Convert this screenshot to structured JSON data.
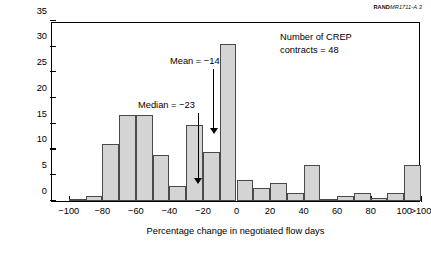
{
  "source_id": {
    "prefix": "RAND",
    "number": "MR1711-A.3"
  },
  "note": {
    "line1": "Number of CREP",
    "line2": "contracts = 48"
  },
  "annotations": [
    {
      "name": "mean-annotation",
      "label": "Mean = −14",
      "value": -14
    },
    {
      "name": "median-annotation",
      "label": "Median = −23",
      "value": -23
    }
  ],
  "chart_data": {
    "type": "bar",
    "title": "",
    "subtitle": "",
    "xlabel": "Percentage change in negotiated flow days",
    "ylabel": "Percentage of NIINs (n = 319)",
    "xlim": [
      -110,
      110
    ],
    "ylim": [
      0,
      35
    ],
    "yticks": [
      0,
      5,
      10,
      15,
      20,
      25,
      30,
      35
    ],
    "ytick_labels": [
      "0",
      "5",
      "10",
      "15",
      "20",
      "25",
      "30",
      "35"
    ],
    "xticks": [
      -100,
      -80,
      -60,
      -40,
      -20,
      0,
      20,
      40,
      60,
      80,
      100,
      110
    ],
    "xtick_labels": [
      "−100",
      "−80",
      "−60",
      "−40",
      "−20",
      "0",
      "20",
      "40",
      "60",
      "80",
      "100",
      ">100"
    ],
    "grid": false,
    "legend": null,
    "bin_width": 10,
    "categories": [
      "-100 to -90",
      "-90 to -80",
      "-80 to -70",
      "-70 to -60",
      "-60 to -50",
      "-50 to -40",
      "-40 to -30",
      "-30 to -20",
      "-20 to -10",
      "-10 to 0",
      "0 to 10",
      "10 to 20",
      "20 to 30",
      "30 to 40",
      "40 to 50",
      "50 to 60",
      "60 to 70",
      "70 to 80",
      "80 to 90",
      "90 to 100",
      ">100"
    ],
    "bin_starts": [
      -100,
      -90,
      -80,
      -70,
      -60,
      -50,
      -40,
      -30,
      -20,
      -10,
      0,
      10,
      20,
      30,
      40,
      50,
      60,
      70,
      80,
      90,
      100
    ],
    "values": [
      0.3,
      1.0,
      11.0,
      16.7,
      16.7,
      9.0,
      3.0,
      14.7,
      9.5,
      30.5,
      4.0,
      2.5,
      3.5,
      1.5,
      7.0,
      0.3,
      1.0,
      1.5,
      0.6,
      1.5,
      7.0
    ],
    "bar_color": "#d4d4d4",
    "bar_edge_color": "#4a4a4a"
  }
}
